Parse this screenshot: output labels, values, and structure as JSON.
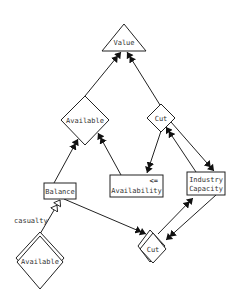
{
  "diagram": {
    "nodes": [
      {
        "id": "value",
        "label": "Value",
        "shape": "triangle"
      },
      {
        "id": "available_top",
        "label": "Available",
        "shape": "diamond"
      },
      {
        "id": "cut_top",
        "label": "Cut",
        "shape": "diamond"
      },
      {
        "id": "availability",
        "label": "Availability",
        "operator": "<=",
        "shape": "box"
      },
      {
        "id": "industry_capacity",
        "label_line1": "Industry",
        "label_line2": "Capacity",
        "shape": "box"
      },
      {
        "id": "balance",
        "label": "Balance",
        "shape": "box"
      },
      {
        "id": "available_bottom",
        "label": "Available",
        "shape": "double-diamond"
      },
      {
        "id": "cut_bottom",
        "label": "Cut",
        "shape": "double-diamond"
      }
    ],
    "edges": [
      {
        "from": "available_top",
        "to": "value",
        "arrow": "double-filled"
      },
      {
        "from": "cut_top",
        "to": "value",
        "arrow": "double-filled"
      },
      {
        "from": "balance",
        "to": "available_top",
        "arrow": "double-filled"
      },
      {
        "from": "availability",
        "to": "available_top",
        "arrow": "double-filled"
      },
      {
        "from": "cut_top",
        "to": "availability",
        "arrow": "double-filled"
      },
      {
        "from": "availability",
        "to": "cut_top",
        "arrow": "double-filled"
      },
      {
        "from": "cut_top",
        "to": "industry_capacity",
        "arrow": "double-filled"
      },
      {
        "from": "available_bottom",
        "to": "balance",
        "arrow": "double-hollow",
        "label": "casualty"
      },
      {
        "from": "balance",
        "to": "cut_bottom",
        "arrow": "double-filled"
      },
      {
        "from": "cut_bottom",
        "to": "industry_capacity",
        "arrow": "double-filled"
      },
      {
        "from": "industry_capacity",
        "to": "cut_bottom",
        "arrow": "double-filled"
      }
    ],
    "edge_labels": {
      "casualty": "casualty"
    }
  }
}
